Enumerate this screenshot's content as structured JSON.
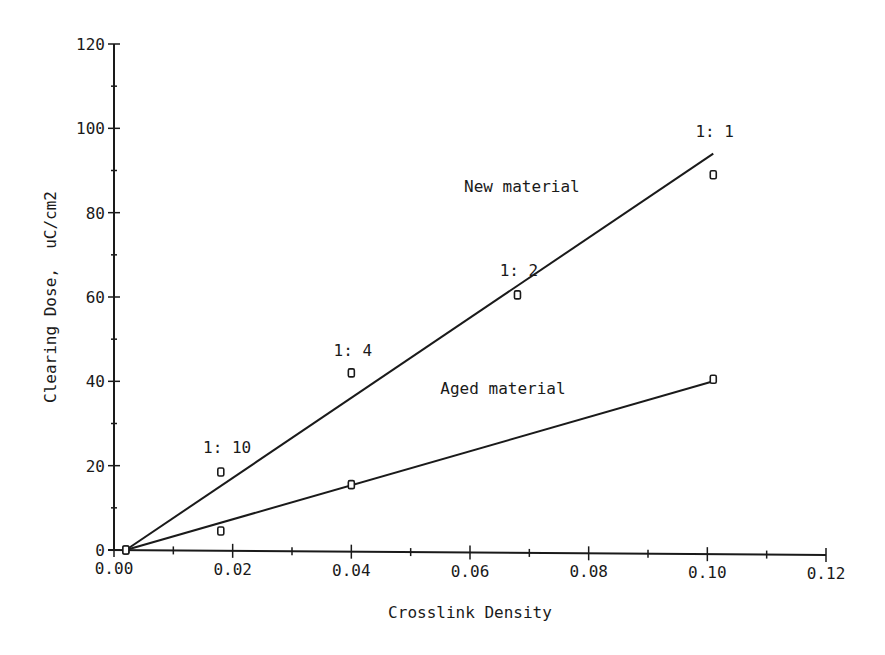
{
  "chart_data": {
    "type": "scatter",
    "title": "",
    "xlabel": "Crosslink Density",
    "ylabel": "Clearing Dose,  uC/cm2",
    "xlim": [
      0.0,
      0.12
    ],
    "ylim": [
      0,
      120
    ],
    "grid": false,
    "legend": "none (inline line labels)",
    "x_ticks": [
      "0.00",
      "0.02",
      "0.04",
      "0.06",
      "0.08",
      "0.10",
      "0.12"
    ],
    "y_ticks": [
      "0",
      "20",
      "40",
      "60",
      "80",
      "100",
      "120"
    ],
    "series": [
      {
        "name": "New material",
        "marker": "square",
        "points": [
          {
            "x": 0.002,
            "y": 0
          },
          {
            "x": 0.018,
            "y": 18.5,
            "label": "1: 10"
          },
          {
            "x": 0.04,
            "y": 42,
            "label": "1: 4"
          },
          {
            "x": 0.068,
            "y": 60.5,
            "label": "1: 2"
          },
          {
            "x": 0.101,
            "y": 89,
            "label": "1: 1"
          }
        ],
        "fit_line": {
          "x0": 0.002,
          "y0": 0,
          "x1": 0.101,
          "y1": 94
        }
      },
      {
        "name": "Aged material",
        "marker": "square",
        "points": [
          {
            "x": 0.002,
            "y": 0
          },
          {
            "x": 0.018,
            "y": 4.5
          },
          {
            "x": 0.04,
            "y": 15.5
          },
          {
            "x": 0.101,
            "y": 40.5
          }
        ],
        "fit_line": {
          "x0": 0.002,
          "y0": 0,
          "x1": 0.101,
          "y1": 40
        }
      }
    ],
    "annotations": [
      {
        "text": "New material",
        "x": 0.059,
        "y": 85
      },
      {
        "text": "Aged material",
        "x": 0.055,
        "y": 37
      },
      {
        "text": "1: 10",
        "x": 0.015,
        "y": 23
      },
      {
        "text": "1: 4",
        "x": 0.037,
        "y": 46
      },
      {
        "text": "1: 2",
        "x": 0.065,
        "y": 65
      },
      {
        "text": "1: 1",
        "x": 0.098,
        "y": 98
      }
    ]
  }
}
